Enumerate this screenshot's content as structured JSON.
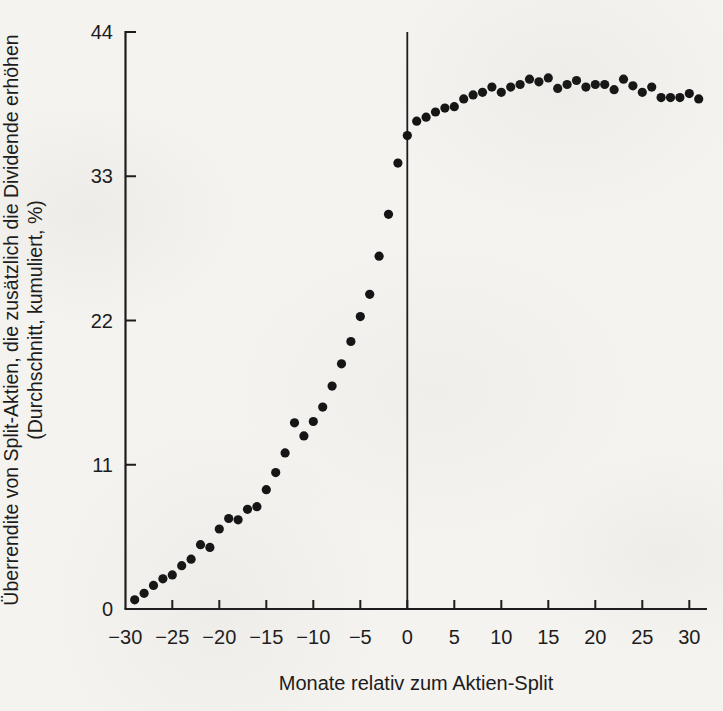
{
  "figure": {
    "y_axis_label_line1": "Überrendite von Split-Aktien, die zusätzlich die Dividende erhöhen",
    "y_axis_label_line2": "(Durchschnitt, kumuliert, %)",
    "x_axis_label": "Monate relativ zum Aktien-Split"
  },
  "colors": {
    "paper": "#f4f3f0",
    "ink": "#1c1c1c",
    "dot": "#141414"
  },
  "chart_data": {
    "type": "scatter",
    "title": "",
    "xlabel": "Monate relativ zum Aktien-Split",
    "ylabel": "Überrendite von Split-Aktien, die zusätzlich die Dividende erhöhen (Durchschnitt, kumuliert, %)",
    "xlim": [
      -31.8,
      32.5
    ],
    "ylim": [
      0,
      44
    ],
    "x_ticks": [
      -30,
      -25,
      -20,
      -15,
      -10,
      -5,
      0,
      5,
      10,
      15,
      20,
      25,
      30
    ],
    "y_ticks": [
      0,
      11,
      22,
      33,
      44
    ],
    "grid": false,
    "legend": "none",
    "marker": {
      "shape": "circle",
      "color": "#141414",
      "radius_px": 4.6
    },
    "reference_line": {
      "axis": "vertical",
      "at_x": 0
    },
    "points": [
      [
        -29,
        0.7
      ],
      [
        -28,
        1.2
      ],
      [
        -27,
        1.8
      ],
      [
        -26,
        2.3
      ],
      [
        -25,
        2.6
      ],
      [
        -24,
        3.3
      ],
      [
        -23,
        3.8
      ],
      [
        -22,
        4.9
      ],
      [
        -21,
        4.7
      ],
      [
        -20,
        6.1
      ],
      [
        -19,
        6.9
      ],
      [
        -18,
        6.8
      ],
      [
        -17,
        7.6
      ],
      [
        -16,
        7.8
      ],
      [
        -15,
        9.1
      ],
      [
        -14,
        10.4
      ],
      [
        -13,
        11.9
      ],
      [
        -12,
        14.2
      ],
      [
        -11,
        13.2
      ],
      [
        -10,
        14.3
      ],
      [
        -9,
        15.4
      ],
      [
        -8,
        17.0
      ],
      [
        -7,
        18.7
      ],
      [
        -6,
        20.4
      ],
      [
        -5,
        22.3
      ],
      [
        -4,
        24.0
      ],
      [
        -3,
        26.9
      ],
      [
        -2,
        30.1
      ],
      [
        -1,
        34.0
      ],
      [
        0,
        36.1
      ],
      [
        1,
        37.2
      ],
      [
        2,
        37.5
      ],
      [
        3,
        37.9
      ],
      [
        4,
        38.2
      ],
      [
        5,
        38.3
      ],
      [
        6,
        38.9
      ],
      [
        7,
        39.2
      ],
      [
        8,
        39.4
      ],
      [
        9,
        39.8
      ],
      [
        10,
        39.4
      ],
      [
        11,
        39.8
      ],
      [
        12,
        40.0
      ],
      [
        13,
        40.4
      ],
      [
        14,
        40.2
      ],
      [
        15,
        40.5
      ],
      [
        16,
        39.7
      ],
      [
        17,
        40.0
      ],
      [
        18,
        40.3
      ],
      [
        19,
        39.8
      ],
      [
        20,
        40.0
      ],
      [
        21,
        40.0
      ],
      [
        22,
        39.6
      ],
      [
        23,
        40.4
      ],
      [
        24,
        39.9
      ],
      [
        25,
        39.4
      ],
      [
        26,
        39.8
      ],
      [
        27,
        39.0
      ],
      [
        28,
        39.0
      ],
      [
        29,
        39.0
      ],
      [
        30,
        39.3
      ],
      [
        31,
        38.9
      ]
    ]
  }
}
